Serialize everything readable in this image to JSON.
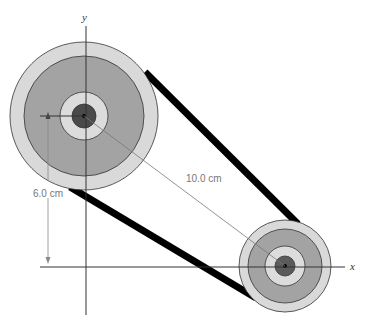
{
  "diagram": {
    "type": "belt-and-pulley",
    "axes": {
      "x_label": "x",
      "y_label": "y"
    },
    "dimensions": {
      "vertical_label": "6.0 cm",
      "center_distance_label": "10.0 cm"
    },
    "pulleys": [
      {
        "name": "large-pulley",
        "cx": 84,
        "cy": 116,
        "r_outer": 74,
        "r_groove": 60,
        "r_hub": 24,
        "r_core": 12
      },
      {
        "name": "small-pulley",
        "cx": 285,
        "cy": 266,
        "r_outer": 46,
        "r_groove": 37,
        "r_hub": 20,
        "r_core": 10
      }
    ],
    "colors": {
      "outer_ring": "#d9d9d9",
      "groove": "#a3a3a3",
      "hub": "#dcdcdc",
      "core": "#4a4a4a",
      "belt": "#000000",
      "axis": "#333333",
      "dimension": "#888888"
    }
  }
}
